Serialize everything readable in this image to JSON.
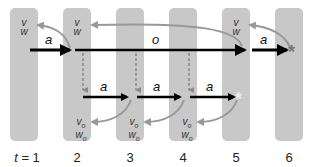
{
  "diagram": {
    "type": "time-step state diagram",
    "timesteps": [
      {
        "label": "t = 1",
        "prefix": "t",
        "value": "= 1"
      },
      {
        "label": "2"
      },
      {
        "label": "3"
      },
      {
        "label": "4"
      },
      {
        "label": "5"
      },
      {
        "label": "6"
      }
    ],
    "state_labels": {
      "top_v": "v",
      "top_w": "w",
      "sub_v": "v",
      "sub_w": "w",
      "sub_suffix": "o"
    },
    "edges": {
      "action_label": "a",
      "option_label": "o"
    },
    "terminal_marks": {
      "t5": "*",
      "t6": "*"
    },
    "colors": {
      "bar": "#c8c8c8",
      "main_arrow": "#000000",
      "feedback_arrow": "#999999",
      "dashed": "#8a8a8a",
      "asterisk_light": "#e8e8e8",
      "asterisk_dark": "#777777"
    }
  }
}
